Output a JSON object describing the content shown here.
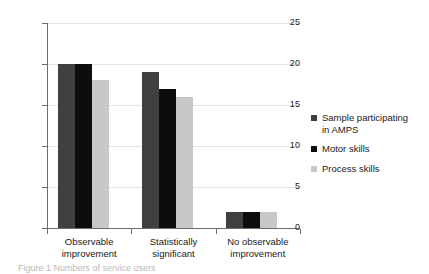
{
  "chart_data": {
    "type": "bar",
    "title": "",
    "subtitle": "",
    "xlabel": "",
    "ylabel": "",
    "ylim": [
      0,
      25
    ],
    "yticks": [
      0,
      5,
      10,
      15,
      20,
      25
    ],
    "ytick_labels": [
      "0",
      "5",
      "10",
      "15",
      "20",
      "25"
    ],
    "grid": true,
    "grid_axis": "y",
    "legend_position": "right",
    "categories": [
      "Observable improvement",
      "Statistically significant",
      "No observable improvement"
    ],
    "category_lines": [
      [
        "Observable",
        "improvement"
      ],
      [
        "Statistically",
        "significant"
      ],
      [
        "No observable",
        "improvement"
      ]
    ],
    "series": [
      {
        "name": "Sample participating in AMPS",
        "name_lines": [
          "Sample participating",
          "in AMPS"
        ],
        "color": "#404040",
        "values": [
          20,
          19,
          2
        ]
      },
      {
        "name": "Motor skills",
        "name_lines": [
          "Motor skills"
        ],
        "color": "#0d0d0d",
        "values": [
          20,
          17,
          2
        ]
      },
      {
        "name": "Process skills",
        "name_lines": [
          "Process skills"
        ],
        "color": "#c8c8c8",
        "values": [
          18,
          16,
          2
        ]
      }
    ]
  },
  "caption": {
    "text": "Figure 1  Numbers of service users"
  },
  "colors": {
    "axis": "#6b6b6b",
    "grid": "#e3e3e3",
    "text": "#1a1a1a",
    "background": "#ffffff"
  }
}
